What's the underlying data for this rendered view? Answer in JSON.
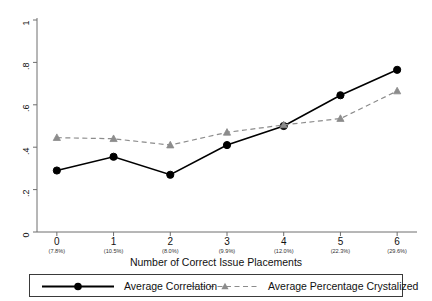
{
  "chart_data": {
    "type": "line",
    "title": "",
    "xlabel": "Number of Correct Issue Placements",
    "ylabel": "",
    "categories": [
      "0",
      "1",
      "2",
      "3",
      "4",
      "5",
      "6"
    ],
    "category_sublabels": [
      "(7.8%)",
      "(10.5%)",
      "(8.0%)",
      "(9.9%)",
      "(12.0%)",
      "(22.3%)",
      "(29.6%)"
    ],
    "x": [
      0,
      1,
      2,
      3,
      4,
      5,
      6
    ],
    "xlim": [
      -0.35,
      6.35
    ],
    "ylim": [
      0,
      1
    ],
    "yticks": [
      "0",
      ".2",
      ".4",
      ".6",
      ".8",
      "1"
    ],
    "ytick_values": [
      0,
      0.2,
      0.4,
      0.6,
      0.8,
      1
    ],
    "grid": false,
    "legend_position": "bottom",
    "series": [
      {
        "name": "Average Correlation",
        "values": [
          0.29,
          0.355,
          0.27,
          0.41,
          0.5,
          0.645,
          0.765
        ],
        "color": "#000000",
        "linestyle": "solid",
        "marker": "circle"
      },
      {
        "name": "Average Percentage Crystalized",
        "values": [
          0.445,
          0.44,
          0.41,
          0.47,
          0.505,
          0.535,
          0.665
        ],
        "color": "#8c8c8c",
        "linestyle": "dashed",
        "marker": "triangle"
      }
    ]
  },
  "legend": {
    "items": [
      {
        "label": "Average Correlation"
      },
      {
        "label": "Average Percentage Crystalized"
      }
    ]
  },
  "colors": {
    "series_1": "#000000",
    "series_2": "#8c8c8c",
    "axis": "#6e6e6e",
    "background": "#ffffff"
  }
}
